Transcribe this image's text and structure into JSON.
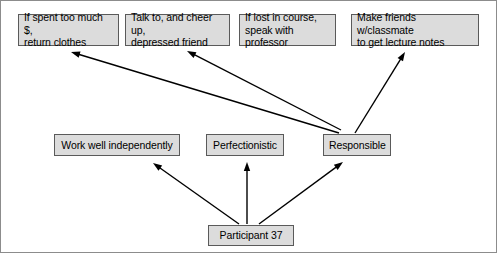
{
  "diagram": {
    "colors": {
      "node_fill": "#dcdcdc",
      "node_border": "#5a5a5a",
      "arrow": "#000000",
      "frame": "#8c8c8c",
      "background": "#ffffff"
    },
    "nodes": [
      {
        "id": "behavior-spend",
        "label": "If spent too much $,\nreturn clothes",
        "row": "top",
        "x": 17,
        "y": 13,
        "w": 101,
        "h": 32,
        "align": "left"
      },
      {
        "id": "behavior-cheer",
        "label": "Talk to, and cheer up,\ndepressed friend",
        "row": "top",
        "x": 124,
        "y": 13,
        "w": 105,
        "h": 32,
        "align": "left"
      },
      {
        "id": "behavior-professor",
        "label": "If lost in course,\nspeak with professor",
        "row": "top",
        "x": 238,
        "y": 13,
        "w": 97,
        "h": 32,
        "align": "left"
      },
      {
        "id": "behavior-notes",
        "label": "Make friends w/classmate\nto get lecture notes",
        "row": "top",
        "x": 350,
        "y": 13,
        "w": 128,
        "h": 32,
        "align": "left"
      },
      {
        "id": "trait-independent",
        "label": "Work well independently",
        "row": "middle",
        "x": 53,
        "y": 133,
        "w": 126,
        "h": 22,
        "align": "center"
      },
      {
        "id": "trait-perfectionistic",
        "label": "Perfectionistic",
        "row": "middle",
        "x": 205,
        "y": 133,
        "w": 78,
        "h": 22,
        "align": "center"
      },
      {
        "id": "trait-responsible",
        "label": "Responsible",
        "row": "middle",
        "x": 322,
        "y": 133,
        "w": 68,
        "h": 22,
        "align": "center"
      },
      {
        "id": "participant",
        "label": "Participant 37",
        "row": "bottom",
        "x": 207,
        "y": 224,
        "w": 86,
        "h": 21,
        "align": "center"
      }
    ],
    "edges": [
      {
        "id": "edge-participant-independent",
        "from": "participant",
        "to": "trait-independent",
        "x1": 238,
        "y1": 223,
        "x2": 152,
        "y2": 162
      },
      {
        "id": "edge-participant-perfectionistic",
        "from": "participant",
        "to": "trait-perfectionistic",
        "x1": 246,
        "y1": 223,
        "x2": 246,
        "y2": 161
      },
      {
        "id": "edge-participant-responsible",
        "from": "participant",
        "to": "trait-responsible",
        "x1": 258,
        "y1": 223,
        "x2": 342,
        "y2": 161
      },
      {
        "id": "edge-responsible-spend",
        "from": "trait-responsible",
        "to": "behavior-spend",
        "x1": 338,
        "y1": 132,
        "x2": 70,
        "y2": 51
      },
      {
        "id": "edge-responsible-cheer",
        "from": "trait-responsible",
        "to": "behavior-cheer",
        "x1": 340,
        "y1": 129,
        "x2": 186,
        "y2": 50
      },
      {
        "id": "edge-responsible-notes",
        "from": "trait-responsible",
        "to": "behavior-notes",
        "x1": 354,
        "y1": 132,
        "x2": 404,
        "y2": 51
      }
    ]
  }
}
